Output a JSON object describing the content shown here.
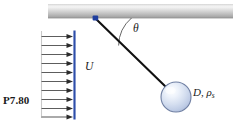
{
  "figure": {
    "problem_label": "P7.80",
    "velocity_label": "U",
    "angle_label": "θ",
    "sphere_label_main": "D, ρ",
    "sphere_label_sub": "s",
    "arrow_count": 10,
    "colors": {
      "ceiling_bar_light": "#f2f2f2",
      "ceiling_bar_mid": "#b8b8b8",
      "ceiling_bar_dark": "#9a9a9a",
      "boundary_line": "#3a5cb8",
      "arrow_line": "#5a5a5a",
      "string": "#111111",
      "pivot": "#1f3e9e",
      "sphere_fill_light": "#f4f7fd",
      "sphere_fill_mid": "#cdd8ef",
      "sphere_edge": "#6f7fa2",
      "text": "#1a1a1a"
    },
    "geometry": {
      "pivot_x": 95,
      "pivot_y": 18,
      "sphere_cx": 176,
      "sphere_cy": 97,
      "sphere_r": 15,
      "bar_left": 48,
      "bar_right": 233,
      "bar_top": 4,
      "bar_bottom": 18,
      "profile_left_x": 41,
      "profile_right_x": 74,
      "profile_top_y": 32,
      "profile_bottom_y": 117
    }
  }
}
